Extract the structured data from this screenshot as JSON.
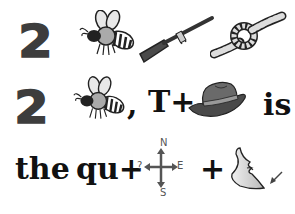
{
  "puzzle": {
    "type": "rebus",
    "row1": {
      "number": "2",
      "pictures": [
        "bee",
        "oar",
        "knot"
      ]
    },
    "row2": {
      "number": "2",
      "comma": ",",
      "t_plus": "T+",
      "picture": "hat",
      "word": "is"
    },
    "row3": {
      "word1": "the",
      "word2": "qu+",
      "compass": {
        "question": "?",
        "north": "N",
        "east": "E",
        "south": "S"
      },
      "plus": "+",
      "picture": "chin"
    }
  },
  "colors": {
    "number": "#3d3d3d",
    "text": "#111111",
    "compass": "#555555",
    "hat": "#4a4a4a"
  }
}
